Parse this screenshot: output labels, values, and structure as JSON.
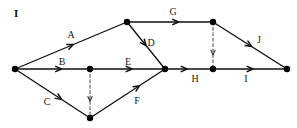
{
  "figure": {
    "caption": "I",
    "caption_x": 14,
    "caption_y": 8,
    "width": 297,
    "height": 128,
    "background_color": "#ffffff",
    "line_color": "#111111",
    "node_color": "#000000",
    "dashed_color": "#333333"
  },
  "chart_data": {
    "type": "diagram",
    "diagram_kind": "activity-on-arrow-network",
    "title": "I",
    "nodes": [
      {
        "id": "n1",
        "x": 15,
        "y": 69,
        "r": 3.2
      },
      {
        "id": "n2",
        "x": 127,
        "y": 22,
        "r": 3.2
      },
      {
        "id": "n3",
        "x": 90,
        "y": 69,
        "r": 3.2
      },
      {
        "id": "n4",
        "x": 90,
        "y": 118,
        "r": 3.2
      },
      {
        "id": "n5",
        "x": 165,
        "y": 69,
        "r": 3.2
      },
      {
        "id": "n6",
        "x": 213,
        "y": 22,
        "r": 3.2
      },
      {
        "id": "n7",
        "x": 213,
        "y": 69,
        "r": 3.2
      },
      {
        "id": "n8",
        "x": 287,
        "y": 69,
        "r": 3.2
      }
    ],
    "edges": [
      {
        "id": "A",
        "from": "n1",
        "to": "n2",
        "style": "solid",
        "arrow_t": 0.52,
        "label": "A",
        "label_x": 71,
        "label_y": 35
      },
      {
        "id": "B",
        "from": "n1",
        "to": "n3",
        "style": "solid",
        "arrow_t": 0.62,
        "label": "B",
        "label_x": 62,
        "label_y": 62
      },
      {
        "id": "C",
        "from": "n1",
        "to": "n4",
        "style": "solid",
        "arrow_t": 0.62,
        "label": "C",
        "label_x": 47,
        "label_y": 102
      },
      {
        "id": "D",
        "from": "n2",
        "to": "n5",
        "style": "solid",
        "arrow_t": 0.5,
        "label": "D",
        "label_x": 151,
        "label_y": 43
      },
      {
        "id": "E",
        "from": "n3",
        "to": "n5",
        "style": "solid",
        "arrow_t": 0.56,
        "label": "E",
        "label_x": 128,
        "label_y": 62
      },
      {
        "id": "F",
        "from": "n4",
        "to": "n5",
        "style": "solid",
        "arrow_t": 0.66,
        "label": "F",
        "label_x": 137,
        "label_y": 101
      },
      {
        "id": "G",
        "from": "n2",
        "to": "n6",
        "style": "solid",
        "arrow_t": 0.6,
        "label": "G",
        "label_x": 173,
        "label_y": 12
      },
      {
        "id": "H",
        "from": "n5",
        "to": "n7",
        "style": "solid",
        "arrow_t": 0.46,
        "label": "H",
        "label_x": 195,
        "label_y": 79
      },
      {
        "id": "I",
        "from": "n7",
        "to": "n8",
        "style": "solid",
        "arrow_t": 0.54,
        "label": "I",
        "label_x": 246,
        "label_y": 79
      },
      {
        "id": "J",
        "from": "n6",
        "to": "n8",
        "style": "solid",
        "arrow_t": 0.52,
        "label": "J",
        "label_x": 259,
        "label_y": 40
      },
      {
        "id": "dummy1",
        "from": "n3",
        "to": "n4",
        "style": "dashed",
        "arrow_t": 0.66,
        "label": "",
        "label_x": 0,
        "label_y": 0
      },
      {
        "id": "dummy2",
        "from": "n6",
        "to": "n7",
        "style": "dashed",
        "arrow_t": 0.7,
        "label": "",
        "label_x": 0,
        "label_y": 0
      }
    ],
    "legend": []
  }
}
